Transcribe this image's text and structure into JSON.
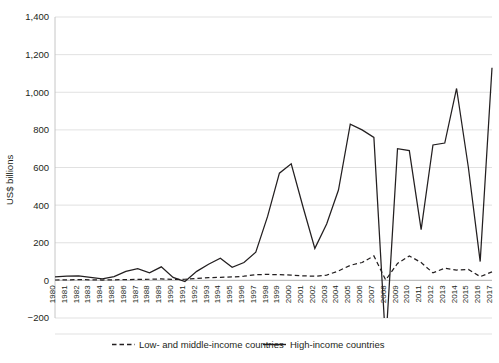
{
  "chart_data": {
    "type": "line",
    "title": "",
    "xlabel": "",
    "ylabel": "US$ billions",
    "ylim": [
      -200,
      1400
    ],
    "yticks": [
      -200,
      0,
      200,
      400,
      600,
      800,
      1000,
      1200,
      1400
    ],
    "ytick_labels": [
      "−200",
      "0",
      "200",
      "400",
      "600",
      "800",
      "1,000",
      "1,200",
      "1,400"
    ],
    "grid": true,
    "legend_position": "bottom",
    "x": [
      1980,
      1981,
      1982,
      1983,
      1984,
      1985,
      1986,
      1987,
      1988,
      1989,
      1990,
      1991,
      1992,
      1993,
      1994,
      1995,
      1996,
      1997,
      1998,
      1999,
      2000,
      2001,
      2002,
      2003,
      2004,
      2005,
      2006,
      2007,
      2008,
      2009,
      2010,
      2011,
      2012,
      2013,
      2014,
      2015,
      2016,
      2017
    ],
    "categories": [
      "1980",
      "1981",
      "1982",
      "1983",
      "1984",
      "1985",
      "1986",
      "1987",
      "1988",
      "1989",
      "1990",
      "1991",
      "1992",
      "1993",
      "1994",
      "1995",
      "1996",
      "1997",
      "1998",
      "1999",
      "2000",
      "2001",
      "2002",
      "2003",
      "2004",
      "2005",
      "2006",
      "2007",
      "2008",
      "2009",
      "2010",
      "2011",
      "2012",
      "2013",
      "2014",
      "2015",
      "2016",
      "2017"
    ],
    "series": [
      {
        "name": "High-income countries",
        "style": "solid",
        "values": [
          18,
          22,
          24,
          16,
          8,
          20,
          48,
          62,
          40,
          72,
          16,
          -6,
          48,
          86,
          118,
          70,
          95,
          150,
          340,
          570,
          620,
          390,
          170,
          300,
          480,
          830,
          800,
          760,
          -340,
          700,
          690,
          270,
          720,
          730,
          1020,
          600,
          100,
          1130
        ]
      },
      {
        "name": "Low- and middle-income countries",
        "style": "dashed",
        "values": [
          2,
          3,
          4,
          3,
          2,
          3,
          4,
          5,
          6,
          8,
          5,
          6,
          10,
          14,
          16,
          18,
          22,
          30,
          32,
          30,
          28,
          24,
          22,
          28,
          50,
          80,
          95,
          130,
          2,
          90,
          130,
          95,
          40,
          65,
          55,
          58,
          20,
          45
        ]
      }
    ]
  },
  "legend": {
    "items": [
      {
        "label": "Low- and middle-income countries",
        "style": "dashed"
      },
      {
        "label": "High-income countries",
        "style": "solid"
      }
    ]
  }
}
